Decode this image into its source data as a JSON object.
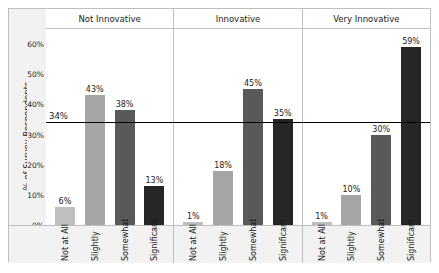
{
  "chart_data": {
    "type": "bar",
    "title": "",
    "xlabel": "",
    "ylabel": "% of Survey Respondents",
    "ylim": [
      0,
      65
    ],
    "grid": false,
    "legend": "none",
    "categories": [
      "Not at All",
      "Slightly",
      "Somewhat",
      "Significant"
    ],
    "panels": [
      {
        "name": "Not Innovative",
        "values": [
          6,
          43,
          38,
          13
        ],
        "labels": [
          "6%",
          "43%",
          "38%",
          "13%"
        ]
      },
      {
        "name": "Innovative",
        "values": [
          1,
          18,
          45,
          35
        ],
        "labels": [
          "1%",
          "18%",
          "45%",
          "35%"
        ]
      },
      {
        "name": "Very Innovative",
        "values": [
          1,
          10,
          30,
          59
        ],
        "labels": [
          "1%",
          "10%",
          "30%",
          "59%"
        ]
      }
    ],
    "yticks": [
      0,
      10,
      20,
      30,
      40,
      50,
      60
    ],
    "ytick_labels": [
      "0%",
      "10%",
      "20%",
      "30%",
      "40%",
      "50%",
      "60%"
    ],
    "reference_line": {
      "value": 34,
      "label": "34%",
      "color": "#000000"
    },
    "bar_colors": [
      "#bfbfbf",
      "#a6a6a6",
      "#595959",
      "#262626"
    ]
  },
  "style": {
    "panel_background": "#ffffff",
    "band_background": "#f2f2f2",
    "frame_color": "#bfbfbf",
    "text_color": "#1a1a1a"
  }
}
